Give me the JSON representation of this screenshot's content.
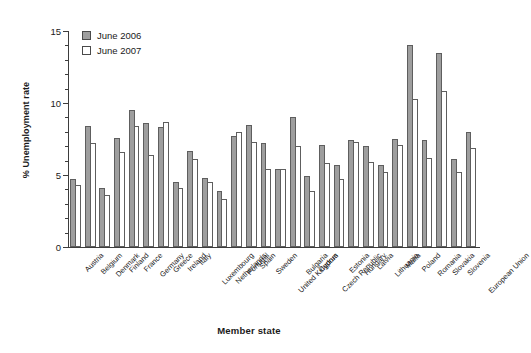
{
  "chart_data": {
    "type": "bar",
    "title": "",
    "xlabel": "Member state",
    "ylabel": "% Unemployment rate",
    "ylim": [
      0,
      15
    ],
    "yticks": [
      0,
      5,
      10,
      15
    ],
    "yminor_step": 1,
    "grid": false,
    "legend_position": "top-left",
    "categories": [
      "Austria",
      "Belgium",
      "Denmark",
      "Finland",
      "France",
      "Germany",
      "Greece",
      "Ireland",
      "Italy",
      "Luxembourg",
      "Netherlands",
      "Portugal",
      "Spain",
      "Sweden",
      "United Kingdom",
      "Bulgaria",
      "Cyprus",
      "Czech Republic",
      "Estonia",
      "Hungary",
      "Latvia",
      "Lithuania",
      "Malta",
      "Poland",
      "Romania",
      "Slovakia",
      "Slovenia",
      "European Union"
    ],
    "series": [
      {
        "name": "June 2006",
        "color": "#9e9e9e",
        "values": [
          4.7,
          8.4,
          4.1,
          7.6,
          9.5,
          8.6,
          8.3,
          4.5,
          6.7,
          4.8,
          3.9,
          7.7,
          8.5,
          7.2,
          5.4,
          9.0,
          4.9,
          7.1,
          5.7,
          7.4,
          7.0,
          5.7,
          7.5,
          14.0,
          7.4,
          13.5,
          6.1,
          8.0
        ],
        "unit": "%"
      },
      {
        "name": "June 2007",
        "color": "#ffffff",
        "values": [
          4.3,
          7.2,
          3.6,
          6.6,
          8.4,
          6.4,
          8.7,
          4.1,
          6.1,
          4.5,
          3.3,
          8.0,
          7.3,
          5.4,
          5.4,
          7.0,
          3.9,
          5.8,
          4.7,
          7.3,
          5.9,
          5.2,
          7.1,
          10.3,
          6.2,
          10.8,
          5.2,
          6.9
        ]
      }
    ]
  },
  "legend": {
    "items": [
      {
        "label": "June 2006",
        "swatch": "filled-gray-swatch"
      },
      {
        "label": "June 2007",
        "swatch": "empty-white-swatch"
      }
    ]
  },
  "axes": {
    "y": {
      "title": "% Unemployment rate",
      "tick_labels": [
        "0",
        "5",
        "10",
        "15"
      ]
    },
    "x": {
      "title": "Member state"
    }
  }
}
